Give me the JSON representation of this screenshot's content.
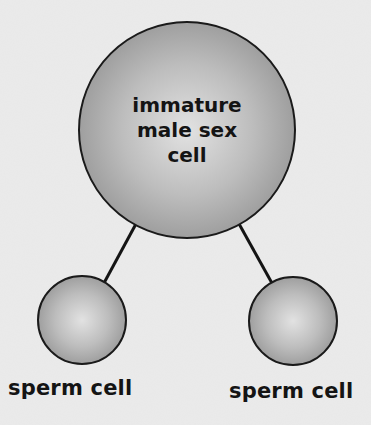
{
  "diagram": {
    "type": "division-tree",
    "colors": {
      "background": "#ebebeb",
      "cell_fill_center": "#dcdcdc",
      "cell_fill_edge": "#999999",
      "outline": "#1a1a1a",
      "text": "#141414"
    },
    "parent": {
      "label_lines": [
        "immature",
        "male sex",
        "cell"
      ]
    },
    "children": [
      {
        "label": "sperm cell"
      },
      {
        "label": "sperm cell"
      }
    ]
  }
}
